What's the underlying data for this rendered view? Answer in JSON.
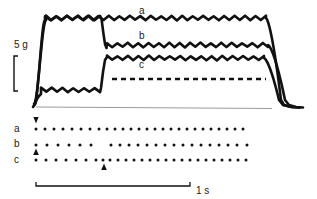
{
  "figure": {
    "kind": "physiology-recording-trace-figure",
    "background_color": "#ffffff",
    "ink_color": "#111111",
    "baseline_color": "#9a9a9a"
  },
  "scale_bars": {
    "vertical": {
      "label": "5 g",
      "value": 5,
      "unit": "g",
      "x": 14,
      "y_top": 56,
      "y_bottom": 91,
      "label_x": 7,
      "label_y": 40
    },
    "horizontal": {
      "label": "1 s",
      "value": 1,
      "unit": "s",
      "x_left": 36,
      "x_right": 190,
      "y": 186,
      "label_x": 196,
      "label_y": 181
    }
  },
  "trace_labels": [
    {
      "text": "a",
      "x": 139,
      "y": 6
    },
    {
      "text": "b",
      "x": 139,
      "y": 31
    },
    {
      "text": "c",
      "x": 139,
      "y": 60
    }
  ],
  "raster_row_labels": [
    {
      "text": "a",
      "x": 14,
      "y": 124
    },
    {
      "text": "b",
      "x": 14,
      "y": 139
    },
    {
      "text": "c",
      "x": 14,
      "y": 155
    }
  ],
  "chart_data": {
    "type": "line",
    "title": "",
    "xlabel": "",
    "ylabel": "",
    "xlim": [
      25,
      300
    ],
    "ylim": [
      0,
      110
    ],
    "grid": false,
    "legend": [
      "a",
      "b",
      "c"
    ],
    "legend_position": "inline-right-of-traces",
    "annotations": [
      {
        "kind": "dashed-reference-line",
        "x_start": 112,
        "x_end": 266,
        "y": 79
      },
      {
        "kind": "baseline",
        "x_start": 36,
        "x_end": 272,
        "y": 107
      }
    ],
    "traces": [
      {
        "name": "a",
        "plateau_y": 18,
        "onset_x": 34,
        "offset_x": 266,
        "ripple_amplitude": 4,
        "ripple_period": 10.5,
        "segments": [
          {
            "from_x": 34,
            "to_x": 46,
            "from_y": 104,
            "to_y": 22,
            "type": "rise"
          },
          {
            "from_x": 46,
            "to_x": 266,
            "y": 18,
            "type": "plateau-rippled"
          },
          {
            "from_x": 266,
            "to_x": 288,
            "from_y": 18,
            "to_y": 107,
            "type": "fall"
          }
        ]
      },
      {
        "name": "b",
        "plateau_y": 45,
        "onset_x": 104,
        "offset_x": 268,
        "ripple_amplitude": 4,
        "ripple_period": 10.5,
        "segments": [
          {
            "from_x": 34,
            "to_x": 44,
            "from_y": 104,
            "to_y": 22,
            "type": "rise-shared-with-a"
          },
          {
            "from_x": 44,
            "to_x": 101,
            "y": 18,
            "type": "plateau-rippled"
          },
          {
            "from_x": 101,
            "to_x": 108,
            "from_y": 18,
            "to_y": 45,
            "type": "step-down"
          },
          {
            "from_x": 108,
            "to_x": 268,
            "y": 45,
            "type": "plateau-rippled"
          },
          {
            "from_x": 268,
            "to_x": 292,
            "from_y": 45,
            "to_y": 107,
            "type": "fall"
          }
        ]
      },
      {
        "name": "c",
        "plateau_y": 58,
        "onset_x": 100,
        "offset_x": 264,
        "ripple_amplitude": 4,
        "ripple_period": 10.5,
        "low_plateau_y": 90,
        "segments": [
          {
            "from_x": 34,
            "to_x": 42,
            "from_y": 106,
            "to_y": 95,
            "type": "rise-low"
          },
          {
            "from_x": 42,
            "to_x": 100,
            "y": 90,
            "type": "low-plateau-rippled"
          },
          {
            "from_x": 100,
            "to_x": 108,
            "from_y": 90,
            "to_y": 58,
            "type": "step-up"
          },
          {
            "from_x": 108,
            "to_x": 264,
            "y": 58,
            "type": "plateau-rippled"
          },
          {
            "from_x": 264,
            "to_x": 286,
            "from_y": 58,
            "to_y": 107,
            "type": "fall"
          }
        ]
      }
    ]
  },
  "raster": {
    "dot_color": "#111111",
    "dot_radius": 1.5,
    "rows": [
      {
        "name": "a",
        "y": 129,
        "dot_x": [
          36,
          45,
          54,
          63,
          72,
          81,
          90,
          99,
          107,
          115,
          123,
          131,
          139,
          147,
          155,
          163,
          171,
          179,
          187,
          195,
          203,
          211,
          219,
          227,
          235,
          243
        ],
        "markers": [
          {
            "kind": "down-arrowhead",
            "x": 36,
            "y": 122
          }
        ]
      },
      {
        "name": "b",
        "y": 145,
        "dot_x": [
          36,
          47,
          58,
          69,
          80,
          91,
          111,
          120,
          129,
          138,
          147,
          156,
          165,
          174,
          183,
          192,
          201,
          210,
          219,
          228,
          237,
          247
        ],
        "markers": [
          {
            "kind": "up-arrowhead",
            "x": 36,
            "y": 149
          }
        ]
      },
      {
        "name": "c",
        "y": 160,
        "dot_x": [
          36,
          46,
          56,
          66,
          76,
          86,
          96,
          103,
          110,
          118,
          126,
          134,
          142,
          150,
          158,
          166,
          174,
          182,
          190,
          198,
          206,
          214,
          222,
          230,
          238,
          246
        ],
        "markers": [
          {
            "kind": "up-arrowhead",
            "x": 104,
            "y": 164
          }
        ]
      }
    ]
  }
}
